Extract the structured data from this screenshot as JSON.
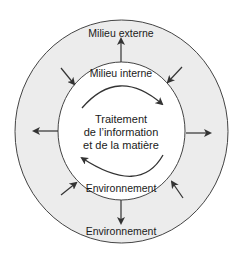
{
  "diagram": {
    "outer_label": "Milieu externe",
    "inner_top_label": "Milieu interne",
    "center_lines": [
      "Traitement",
      "de l’information",
      "et de la matière"
    ],
    "inner_bottom_label": "Environnement",
    "outer_bottom_label": "Environnement",
    "colors": {
      "outer_ring_fill": "#ececec",
      "inner_fill": "#ffffff",
      "stroke": "#444444",
      "arrow": "#333333",
      "text": "#1a1a1a"
    },
    "arrows": {
      "outward": [
        "top",
        "left",
        "right",
        "bottom"
      ],
      "inward": [
        "top-left",
        "top-right",
        "bottom-left",
        "bottom-right"
      ],
      "cycle": [
        "top-arc-clockwise",
        "bottom-arc-clockwise"
      ]
    }
  }
}
